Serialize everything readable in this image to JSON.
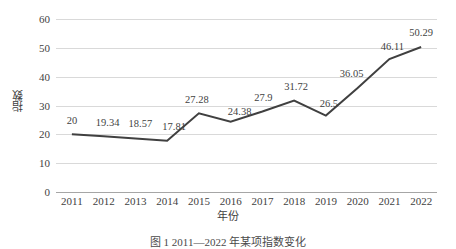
{
  "chart_data": {
    "type": "line",
    "title": "",
    "categories": [
      "2011",
      "2012",
      "2013",
      "2014",
      "2015",
      "2016",
      "2017",
      "2018",
      "2019",
      "2020",
      "2021",
      "2022"
    ],
    "values": [
      20,
      19.34,
      18.57,
      17.81,
      27.28,
      24.38,
      27.9,
      31.72,
      26.5,
      36.05,
      46.11,
      50.29
    ],
    "point_labels": [
      "20",
      "19.34",
      "18.57",
      "17.81",
      "27.28",
      "24.38",
      "27.9",
      "31.72",
      "26.5",
      "36.05",
      "46.11",
      "50.29"
    ],
    "xlabel": "年份",
    "ylabel": "指数",
    "ylim": [
      0,
      60
    ],
    "yticks": [
      0,
      10,
      20,
      30,
      40,
      50,
      60
    ],
    "ytick_labels": [
      "0",
      "10",
      "20",
      "30",
      "40",
      "50",
      "60"
    ],
    "grid": true,
    "legend": false,
    "legend_position": "none",
    "series": [
      {
        "name": "指数",
        "color": "#404040",
        "values": [
          20,
          19.34,
          18.57,
          17.81,
          27.28,
          24.38,
          27.9,
          31.72,
          26.5,
          36.05,
          46.11,
          50.29
        ]
      }
    ]
  },
  "colors": {
    "line": "#404040",
    "gridline": "#d9d9d9",
    "axis": "#a6a6a6",
    "text": "#3f3f3f",
    "background": "#ffffff"
  },
  "caption": {
    "text": "图 1  2011—2022 年某项指数变化"
  }
}
